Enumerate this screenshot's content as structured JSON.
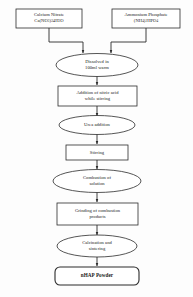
{
  "diagram": {
    "type": "process-flowchart",
    "orientation": "vertical",
    "background_color": "#fdfdfd",
    "stroke_color": "#2b2b2b",
    "nodes": [
      {
        "id": "calcium-nitrate",
        "shape": "rectangle",
        "label_line1": "Calcium Nitrate",
        "label_line2_parts": [
          {
            "t": "Ca(NO"
          },
          {
            "sub": "3"
          },
          {
            "t": ")"
          },
          {
            "sub": "2"
          },
          {
            "t": "4H"
          },
          {
            "sub": "2"
          },
          {
            "t": "O"
          }
        ]
      },
      {
        "id": "ammonium-phosphate",
        "shape": "rectangle",
        "label_line1": "Ammonium Phosphate",
        "label_line2_parts": [
          {
            "t": "(NH"
          },
          {
            "sub": "4"
          },
          {
            "t": ")"
          },
          {
            "sub": "2"
          },
          {
            "t": "HPO"
          },
          {
            "sub": "4"
          }
        ]
      },
      {
        "id": "dissolved",
        "shape": "ellipse",
        "label_line1": "Dissolved in",
        "label_line2": "100ml warm"
      },
      {
        "id": "nitric-acid",
        "shape": "rectangle",
        "label_line1": "Addition of nitric acid",
        "label_line2": "while stirring"
      },
      {
        "id": "urea-addition",
        "shape": "ellipse",
        "label_line1": "Urea addition"
      },
      {
        "id": "stirring",
        "shape": "rectangle",
        "label_line1": "Stirring"
      },
      {
        "id": "combustion",
        "shape": "ellipse",
        "label_line1": "Combustion of",
        "label_line2": "solution"
      },
      {
        "id": "grinding",
        "shape": "rectangle",
        "label_line1": "Grinding of combustion",
        "label_line2": "products"
      },
      {
        "id": "calcination",
        "shape": "ellipse",
        "label_line1": "Calcination and",
        "label_line2": "sintering"
      },
      {
        "id": "nhap-powder",
        "shape": "rounded-rectangle",
        "label_line1": "nHAP Powder",
        "emphasis": "bold"
      }
    ]
  }
}
